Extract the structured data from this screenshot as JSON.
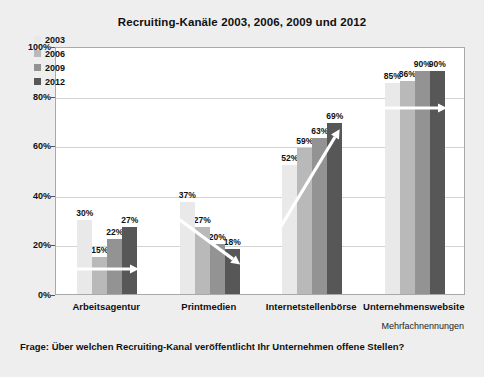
{
  "chart_data": {
    "type": "bar",
    "title": "Recruiting-Kanäle 2003, 2006, 2009 und 2012",
    "xlabel": "",
    "ylabel": "",
    "ylim": [
      0,
      100
    ],
    "ytick_labels": [
      "100%",
      "80%",
      "60%",
      "40%",
      "20%",
      "0%"
    ],
    "ytick_values": [
      100,
      80,
      60,
      40,
      20,
      0
    ],
    "grid": true,
    "legend_position": "upper-left-inside",
    "categories": [
      "Arbeitsagentur",
      "Printmedien",
      "Internetstellenbörse",
      "Unternehmenswebsite"
    ],
    "series": [
      {
        "name": "2003",
        "color": "#e9e9e9",
        "values": [
          30,
          37,
          52,
          85
        ],
        "labels": [
          "30%",
          "37%",
          "52%",
          "85%"
        ]
      },
      {
        "name": "2006",
        "color": "#b9b9b9",
        "values": [
          15,
          27,
          59,
          86
        ],
        "labels": [
          "15%",
          "27%",
          "59%",
          "86%"
        ]
      },
      {
        "name": "2009",
        "color": "#939393",
        "values": [
          22,
          20,
          63,
          90
        ],
        "labels": [
          "22%",
          "20%",
          "63%",
          "90%"
        ]
      },
      {
        "name": "2012",
        "color": "#575757",
        "values": [
          27,
          18,
          69,
          90
        ],
        "labels": [
          "27%",
          "18%",
          "69%",
          "90%"
        ]
      }
    ],
    "annotations": {
      "trend_arrows": [
        {
          "group": "Arbeitsagentur",
          "direction": "flat",
          "color": "#ffffff"
        },
        {
          "group": "Printmedien",
          "direction": "down",
          "color": "#ffffff"
        },
        {
          "group": "Internetstellenbörse",
          "direction": "up",
          "color": "#ffffff"
        },
        {
          "group": "Unternehmenswebsite",
          "direction": "flat",
          "color": "#ffffff"
        }
      ],
      "footnote": "Mehrfachnennungen",
      "question": "Frage: Über welchen Recruiting-Kanal veröffentlicht Ihr Unternehmen offene Stellen?"
    }
  }
}
